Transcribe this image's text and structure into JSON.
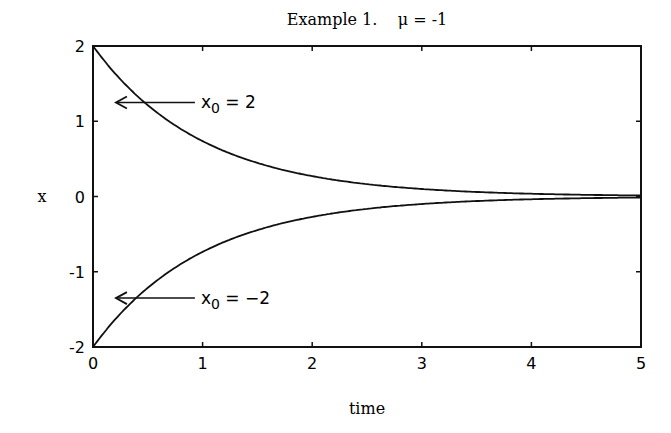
{
  "chart_data": {
    "type": "line",
    "title": "Example 1.    μ = -1",
    "xlabel": "time",
    "ylabel": "x",
    "xlim": [
      0,
      5
    ],
    "ylim": [
      -2,
      2
    ],
    "xticks": [
      "0",
      "1",
      "2",
      "3",
      "4",
      "5"
    ],
    "yticks": [
      "2",
      "1",
      "0",
      "-1",
      "-2"
    ],
    "grid": false,
    "legend": null,
    "series": [
      {
        "name": "x0 = 2",
        "x": [
          0,
          0.25,
          0.5,
          0.75,
          1,
          1.5,
          2,
          2.5,
          3,
          3.5,
          4,
          4.5,
          5
        ],
        "values": [
          2.0,
          1.56,
          1.21,
          0.94,
          0.74,
          0.45,
          0.27,
          0.16,
          0.1,
          0.06,
          0.04,
          0.02,
          0.01
        ]
      },
      {
        "name": "x0 = -2",
        "x": [
          0,
          0.25,
          0.5,
          0.75,
          1,
          1.5,
          2,
          2.5,
          3,
          3.5,
          4,
          4.5,
          5
        ],
        "values": [
          -2.0,
          -1.56,
          -1.21,
          -0.94,
          -0.74,
          -0.45,
          -0.27,
          -0.16,
          -0.1,
          -0.06,
          -0.04,
          -0.02,
          -0.01
        ]
      }
    ],
    "annotations": [
      {
        "text_base": "x",
        "text_sub": "0",
        "text_rest": " = 2",
        "arrow_to": [
          0.2,
          1.25
        ]
      },
      {
        "text_base": "x",
        "text_sub": "0",
        "text_rest": " = −2",
        "arrow_to": [
          0.2,
          -1.35
        ]
      }
    ]
  }
}
